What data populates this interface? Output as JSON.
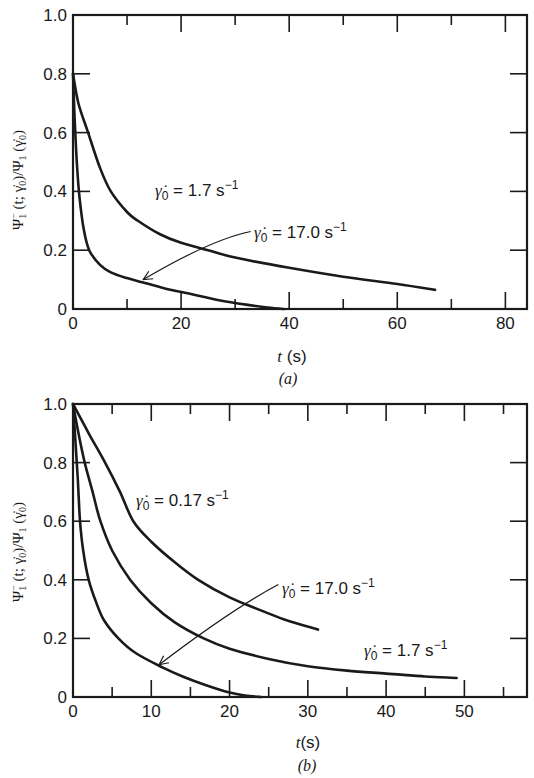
{
  "chart_data": [
    {
      "type": "line",
      "panel": "(a)",
      "title": "",
      "xlabel": "t (s)",
      "ylabel": "Ψ1−(t; γ̇0)/Ψ1(γ̇0)",
      "xlim": [
        0,
        84
      ],
      "ylim": [
        0,
        1.0
      ],
      "xticks": [
        0,
        20,
        40,
        60,
        80
      ],
      "xminor": [
        10,
        30,
        50,
        70
      ],
      "yticks": [
        0,
        0.2,
        0.4,
        0.6,
        0.8,
        1.0
      ],
      "ytick_labels": [
        "0",
        "0.2",
        "0.4",
        "0.6",
        "0.8",
        "1.0"
      ],
      "grid": false,
      "series": [
        {
          "name": "γ̇0 = 1.7 s−1",
          "x": [
            0,
            1,
            2.8,
            5,
            7,
            10,
            12,
            16,
            20,
            25,
            30,
            40,
            50,
            60,
            67
          ],
          "y": [
            0.8,
            0.7,
            0.6,
            0.48,
            0.4,
            0.33,
            0.3,
            0.255,
            0.225,
            0.2,
            0.175,
            0.14,
            0.11,
            0.085,
            0.065
          ]
        },
        {
          "name": "γ̇0 = 17.0 s−1",
          "x": [
            0,
            0.3,
            0.7,
            1.2,
            2,
            3,
            5,
            7,
            10,
            13,
            17,
            22,
            27,
            32,
            36,
            39
          ],
          "y": [
            0.8,
            0.65,
            0.5,
            0.38,
            0.27,
            0.2,
            0.15,
            0.125,
            0.105,
            0.09,
            0.07,
            0.05,
            0.03,
            0.015,
            0.005,
            0.0
          ]
        }
      ],
      "annotations": [
        {
          "text": "γ̇0 = 1.7 s−1",
          "x": 11,
          "y": 0.42
        },
        {
          "text": "γ̇0 = 17.0 s−1",
          "x": 34,
          "y": 0.25,
          "arrow_to": [
            13,
            0.1
          ]
        }
      ]
    },
    {
      "type": "line",
      "panel": "(b)",
      "title": "",
      "xlabel": "t(s)",
      "ylabel": "Ψ1−(t; γ̇0)/Ψ1(γ̇0)",
      "xlim": [
        0,
        58
      ],
      "ylim": [
        0,
        1.0
      ],
      "xticks": [
        0,
        10,
        20,
        30,
        40,
        50
      ],
      "xminor": [
        5,
        15,
        25,
        35,
        45,
        55
      ],
      "yticks": [
        0,
        0.2,
        0.4,
        0.6,
        0.8,
        1.0
      ],
      "ytick_labels": [
        "0",
        "0.2",
        "0.4",
        "0.6",
        "0.8",
        "1.0"
      ],
      "grid": false,
      "series": [
        {
          "name": "γ̇0 = 0.17 s−1",
          "x": [
            0,
            2,
            3.9,
            6,
            7.7,
            10,
            13,
            16,
            20,
            23.6,
            27,
            31.3
          ],
          "y": [
            1.0,
            0.9,
            0.81,
            0.7,
            0.6,
            0.53,
            0.46,
            0.4,
            0.34,
            0.3,
            0.265,
            0.23
          ]
        },
        {
          "name": "γ̇0 = 1.7 s−1",
          "x": [
            0,
            0.7,
            1.5,
            2.5,
            3.5,
            5,
            7.3,
            10,
            13,
            16.7,
            20,
            25,
            30,
            35,
            40,
            45,
            49
          ],
          "y": [
            1.0,
            0.9,
            0.8,
            0.7,
            0.6,
            0.5,
            0.4,
            0.32,
            0.255,
            0.2,
            0.165,
            0.13,
            0.105,
            0.09,
            0.08,
            0.07,
            0.065
          ]
        },
        {
          "name": "γ̇0 = 17.0 s−1",
          "x": [
            0,
            0.3,
            0.6,
            0.9,
            1.3,
            2,
            3,
            4,
            5.8,
            8,
            11.5,
            14,
            17,
            20,
            22,
            24
          ],
          "y": [
            1.0,
            0.88,
            0.75,
            0.6,
            0.5,
            0.4,
            0.32,
            0.26,
            0.2,
            0.15,
            0.1,
            0.07,
            0.04,
            0.015,
            0.005,
            0.0
          ]
        }
      ],
      "annotations": [
        {
          "text": "γ̇0 = 0.17 s−1",
          "x": 9,
          "y": 0.68
        },
        {
          "text": "γ̇0 = 17.0 s−1",
          "x": 27,
          "y": 0.37,
          "arrow_to": [
            11,
            0.11
          ]
        },
        {
          "text": "γ̇0 = 1.7 s−1",
          "x": 38,
          "y": 0.13
        }
      ]
    }
  ],
  "labels": {
    "a": {
      "xlabel_var": "t",
      "xlabel_unit": " (s)",
      "panel": "(a)",
      "annot1": {
        "pre": "γ̇",
        "sub": "0",
        "post": " = 1.7 s",
        "sup": "−1"
      },
      "annot2": {
        "pre": "γ̇",
        "sub": "0",
        "post": " = 17.0 s",
        "sup": "−1"
      }
    },
    "b": {
      "xlabel_var": "t",
      "xlabel_unit": "(s)",
      "panel": "(b)",
      "annot1": {
        "pre": "γ̇",
        "sub": "0",
        "post": " = 0.17 s",
        "sup": "−1"
      },
      "annot2": {
        "pre": "γ̇",
        "sub": "0",
        "post": " = 17.0 s",
        "sup": "−1"
      },
      "annot3": {
        "pre": "γ̇",
        "sub": "0",
        "post": " = 1.7 s",
        "sup": "−1"
      }
    },
    "ylabel": {
      "psi": "Ψ",
      "sub1": "1",
      "sup1": "−",
      "args": " (t; γ̇",
      "sub0": "0",
      "mid": ")/Ψ",
      "sub2": "1",
      "args2": " (γ̇",
      "sub3": "0",
      "end": ")"
    }
  }
}
